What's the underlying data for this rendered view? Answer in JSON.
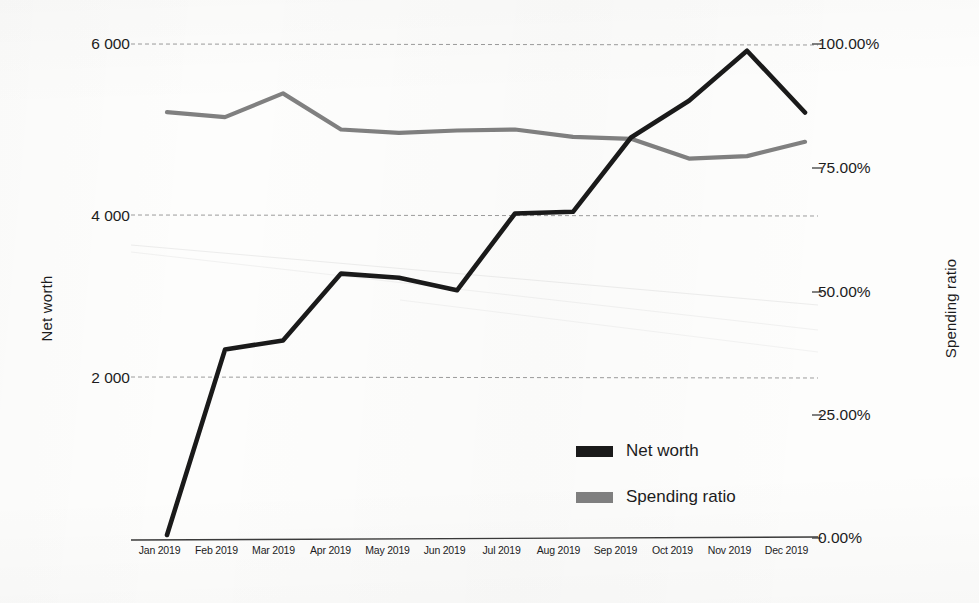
{
  "chart_data": {
    "type": "line",
    "title": "",
    "xlabel": "",
    "ylabel": "Net worth",
    "y2label": "Spending ratio",
    "grid": true,
    "legend_position": "inside-bottom-right",
    "categories": [
      "Jan 2019",
      "Feb 2019",
      "Mar 2019",
      "Apr 2019",
      "May 2019",
      "Jun 2019",
      "Jul 2019",
      "Aug 2019",
      "Sep 2019",
      "Oct 2019",
      "Nov 2019",
      "Dec 2019"
    ],
    "ylim": [
      0,
      6600
    ],
    "yticks": [
      2000,
      4000,
      6000
    ],
    "ytick_labels": [
      "2 000",
      "4 000",
      "6 000"
    ],
    "y2lim": [
      0,
      1.0
    ],
    "y2ticks": [
      0,
      0.25,
      0.5,
      0.75,
      1.0
    ],
    "y2tick_labels": [
      "0.00%",
      "25.00%",
      "50.00%",
      "75.00%",
      "100.00%"
    ],
    "series": [
      {
        "name": "Net worth",
        "axis": "left",
        "color": "#1a1a1a",
        "values": [
          120,
          2340,
          2450,
          3250,
          3200,
          3050,
          3970,
          3990,
          4880,
          5320,
          5920,
          5180
        ]
      },
      {
        "name": "Spending ratio",
        "axis": "right",
        "color": "#808080",
        "values": [
          0.862,
          0.852,
          0.9,
          0.827,
          0.82,
          0.825,
          0.827,
          0.812,
          0.808,
          0.768,
          0.773,
          0.802
        ]
      }
    ]
  },
  "axes": {
    "left_title": "Net worth",
    "right_title": "Spending ratio",
    "left_ticks": [
      "6 000",
      "4 000",
      "2 000"
    ],
    "right_ticks": [
      "100.00%",
      "75.00%",
      "50.00%",
      "25.00%",
      "0.00%"
    ],
    "x_ticks": [
      "Jan 2019",
      "Feb 2019",
      "Mar 2019",
      "Apr 2019",
      "May 2019",
      "Jun 2019",
      "Jul 2019",
      "Aug 2019",
      "Sep 2019",
      "Oct 2019",
      "Nov 2019",
      "Dec 2019"
    ]
  },
  "legend": {
    "items": [
      {
        "label": "Net worth",
        "color": "#1a1a1a"
      },
      {
        "label": "Spending ratio",
        "color": "#808080"
      }
    ]
  },
  "colors": {
    "net_worth": "#1a1a1a",
    "spending_ratio": "#808080",
    "gridline": "#8c8c8c",
    "axis": "#3a3a3a",
    "background": "#fdfdfc"
  }
}
